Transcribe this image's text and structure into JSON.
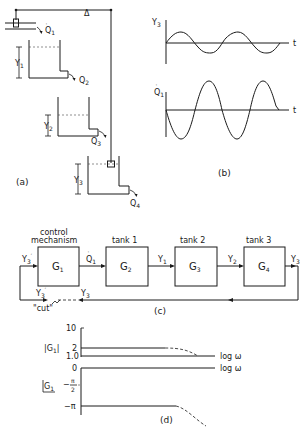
{
  "figure": {
    "panel_a": {
      "caption": "(a)",
      "labels": {
        "q1": "Q",
        "q1_sub": "1",
        "q2": "Q",
        "q2_sub": "2",
        "q3": "Q",
        "q3_sub": "3",
        "q4": "Q",
        "q4_sub": "4",
        "y1": "Y",
        "y1_sub": "1",
        "y2": "Y",
        "y2_sub": "2",
        "y3": "Y",
        "y3_sub": "3",
        "delta": "Δ"
      }
    },
    "panel_b": {
      "caption": "(b)",
      "top_axis_label": "Y",
      "top_axis_sub": "3",
      "bottom_axis_label": "Q",
      "bottom_axis_sub": "1",
      "time_label_top": "t",
      "time_label_bottom": "t"
    },
    "panel_c": {
      "caption": "(c)",
      "blocks": [
        {
          "header": "control",
          "header2": "mechanism",
          "name": "G",
          "sub": "1"
        },
        {
          "header": "tank 1",
          "name": "G",
          "sub": "2"
        },
        {
          "header": "tank 2",
          "name": "G",
          "sub": "3"
        },
        {
          "header": "tank 3",
          "name": "G",
          "sub": "4"
        }
      ],
      "signals": {
        "input": "Y",
        "input_sub": "3",
        "input_prime": "′",
        "q1": "Q",
        "q1_sub": "1",
        "y1": "Y",
        "y1_sub": "1",
        "y2": "Y",
        "y2_sub": "2",
        "y3": "Y",
        "y3_sub": "3",
        "fb_y3prime": "Y",
        "fb_y3prime_sub": "3",
        "fb_y3": "Y",
        "fb_y3_sub": "3"
      },
      "cut_label": "\"cut\""
    },
    "panel_d": {
      "caption": "(d)",
      "magnitude_label": "|G",
      "magnitude_sub": "1",
      "magnitude_close": "|",
      "mag_ticks": [
        "10",
        "2",
        "1.0"
      ],
      "phase_label": "G",
      "phase_sub": "1",
      "phase_ticks": [
        "0",
        "−",
        "π",
        "2",
        "−π"
      ],
      "x_label_top": "log ω",
      "x_label_bottom": "log ω"
    }
  }
}
